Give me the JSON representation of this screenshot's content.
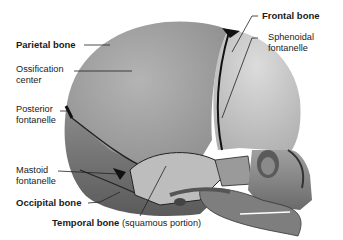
{
  "diagram": {
    "labels": {
      "parietal_bone": "Parietal bone",
      "ossification_center_1": "Ossification",
      "ossification_center_2": "center",
      "posterior_fontanelle_1": "Posterior",
      "posterior_fontanelle_2": "fontanelle",
      "mastoid_fontanelle_1": "Mastoid",
      "mastoid_fontanelle_2": "fontanelle",
      "occipital_bone": "Occipital bone",
      "temporal_bone": "Temporal bone",
      "temporal_bone_note": "(squamous portion)",
      "frontal_bone": "Frontal bone",
      "sphenoidal_fontanelle_1": "Sphenoidal",
      "sphenoidal_fontanelle_2": "fontanelle"
    },
    "colors": {
      "parietal": "#a9a9a9",
      "frontal": "#cfcfcf",
      "occipital": "#7a7a7a",
      "suture": "#111111",
      "face": "#8c8c8c",
      "leader": "#222222"
    }
  }
}
